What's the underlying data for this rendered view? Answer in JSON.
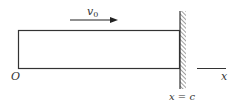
{
  "diagram": {
    "velocity_label": "v",
    "velocity_subscript": "0",
    "origin_label": "O",
    "axis_label": "x",
    "wall_label": "x = c",
    "colors": {
      "stroke": "#333333",
      "background": "#ffffff"
    }
  }
}
